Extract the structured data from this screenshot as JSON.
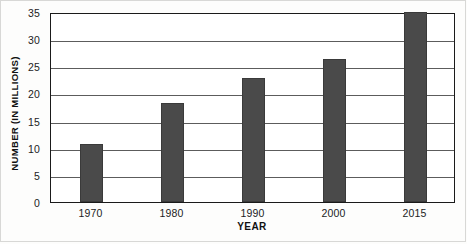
{
  "chart_data": {
    "type": "bar",
    "title": "",
    "xlabel": "YEAR",
    "ylabel": "NUMBER (IN MILLIONS)",
    "categories": [
      "1970",
      "1980",
      "1990",
      "2000",
      "2015"
    ],
    "values": [
      10.7,
      18.3,
      22.8,
      26.4,
      35.0
    ],
    "series": [
      {
        "name": "Number (in millions)",
        "values": [
          10.7,
          18.3,
          22.8,
          26.4,
          35.0
        ]
      }
    ],
    "ylim": [
      0,
      35
    ],
    "ytick_labels": [
      "0",
      "5",
      "10",
      "15",
      "20",
      "25",
      "30",
      "35"
    ],
    "ytick_values": [
      0,
      5,
      10,
      15,
      20,
      25,
      30,
      35
    ],
    "grid": true,
    "legend": null,
    "bar_color": "#4a4a4a",
    "axis_color": "#1a1a1a",
    "gridline_color": "#5c5c5c",
    "background_color": "#ffffff"
  }
}
